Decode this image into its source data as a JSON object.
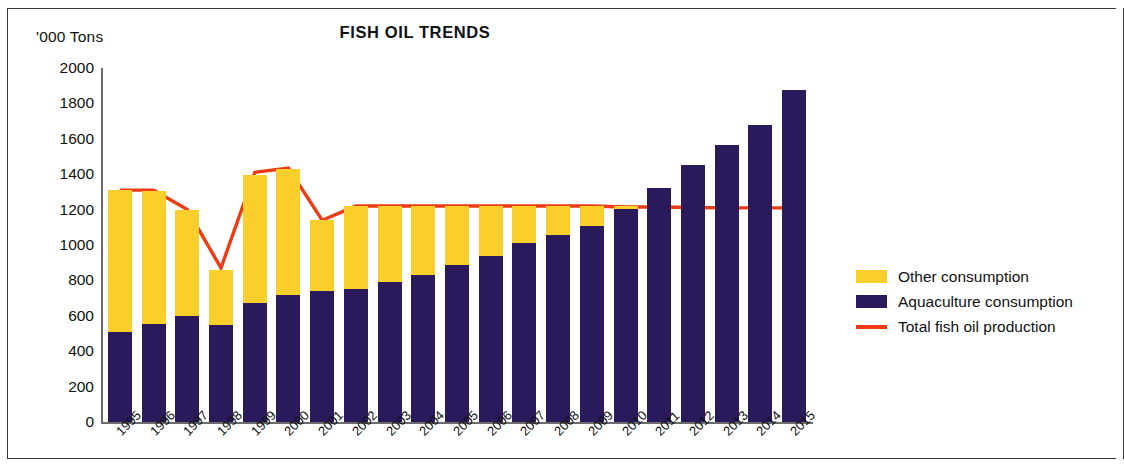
{
  "header": {
    "title": "FISH OIL TRENDS",
    "unit_label": "'000 Tons"
  },
  "legend": {
    "items": [
      {
        "label": "Other consumption",
        "color": "#FBCF2B",
        "marker": "swatch"
      },
      {
        "label": "Aquaculture consumption",
        "color": "#2A1A5C",
        "marker": "swatch"
      },
      {
        "label": "Total fish oil production",
        "color": "#EE3B13",
        "marker": "line"
      }
    ]
  },
  "chart_data": {
    "type": "bar",
    "title": "FISH OIL TRENDS",
    "xlabel": "",
    "ylabel": "'000 Tons",
    "ylim": [
      0,
      2000
    ],
    "yticks": [
      0,
      200,
      400,
      600,
      800,
      1000,
      1200,
      1400,
      1600,
      1800,
      2000
    ],
    "ytick_labels": [
      "0",
      "200",
      "400",
      "600",
      "800",
      "1000",
      "1200",
      "1400",
      "1600",
      "1800",
      "2000"
    ],
    "grid": false,
    "stacked": true,
    "legend_position": "right",
    "categories": [
      "1995",
      "1996",
      "1997",
      "1998",
      "1999",
      "2000",
      "2001",
      "2002",
      "2003",
      "2004",
      "2005",
      "2006",
      "2007",
      "2008",
      "2009",
      "2010",
      "2011",
      "2012",
      "2013",
      "2014",
      "2015"
    ],
    "series": [
      {
        "name": "Aquaculture consumption",
        "type": "bar",
        "color": "#2A1A5C",
        "values": [
          510,
          555,
          600,
          550,
          675,
          715,
          740,
          750,
          790,
          830,
          885,
          940,
          1010,
          1055,
          1110,
          1205,
          1320,
          1450,
          1565,
          1680,
          1875
        ]
      },
      {
        "name": "Other consumption",
        "type": "bar",
        "color": "#FBCF2B",
        "values": [
          800,
          750,
          600,
          310,
          720,
          715,
          400,
          470,
          430,
          390,
          335,
          280,
          210,
          165,
          110,
          15,
          0,
          0,
          0,
          0,
          0
        ]
      },
      {
        "name": "Total fish oil production",
        "type": "line",
        "color": "#EE3B13",
        "values": [
          1310,
          1310,
          1200,
          870,
          1410,
          1435,
          1140,
          1220,
          1220,
          1220,
          1220,
          1220,
          1220,
          1220,
          1220,
          1215,
          1215,
          1212,
          1210,
          1210,
          1210
        ]
      }
    ],
    "stacked_totals": [
      1310,
      1305,
      1200,
      860,
      1395,
      1430,
      1140,
      1220,
      1220,
      1220,
      1220,
      1220,
      1220,
      1220,
      1220,
      1220,
      1320,
      1450,
      1565,
      1680,
      1875
    ]
  }
}
